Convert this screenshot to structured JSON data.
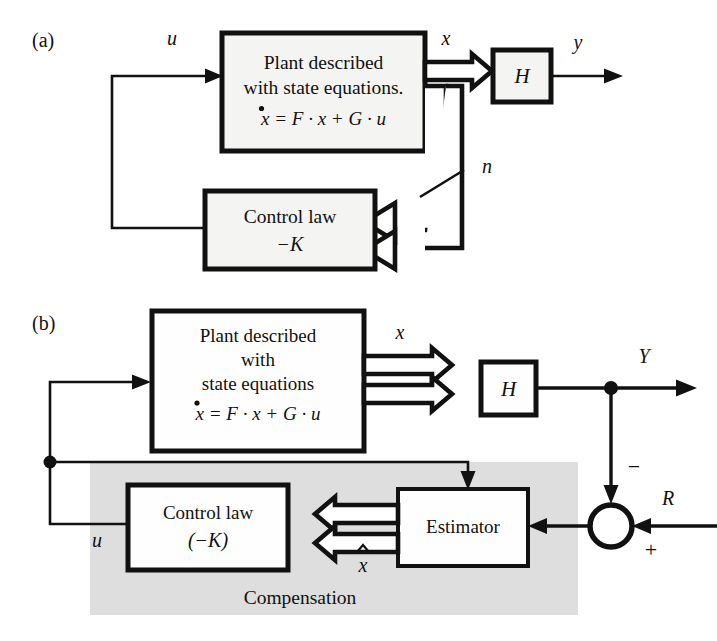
{
  "figure": {
    "type": "block-diagram",
    "panels": [
      {
        "id": "a",
        "label": "(a)",
        "caption": "State feedback using measured state",
        "blocks": [
          {
            "name": "plant",
            "lines": [
              "Plant described",
              "with state equations."
            ],
            "equation": "x = F · x + G · u",
            "equation_lhs": "x",
            "equation_lhs_accent": "dot"
          },
          {
            "name": "control-law",
            "lines": [
              "Control law"
            ],
            "gain": "−K"
          },
          {
            "name": "output-matrix",
            "label": "H"
          }
        ],
        "signals": [
          {
            "name": "u",
            "label": "u",
            "kind": "scalar"
          },
          {
            "name": "x",
            "label": "x",
            "kind": "vector"
          },
          {
            "name": "y",
            "label": "y",
            "kind": "scalar"
          },
          {
            "name": "n",
            "label": "n",
            "kind": "bus-width"
          }
        ]
      },
      {
        "id": "b",
        "label": "(b)",
        "caption": "Output feedback with estimator and compensation",
        "blocks": [
          {
            "name": "plant",
            "lines": [
              "Plant described",
              "with",
              "state equations"
            ],
            "equation": "x = F · x + G · u",
            "equation_lhs": "x",
            "equation_lhs_accent": "dot"
          },
          {
            "name": "control-law",
            "lines": [
              "Control law"
            ],
            "gain": "(−K)"
          },
          {
            "name": "estimator",
            "label": "Estimator"
          },
          {
            "name": "output-matrix",
            "label": "H"
          }
        ],
        "region": {
          "name": "compensation",
          "label": "Compensation",
          "fill": "#dedede"
        },
        "summing_junction": {
          "name": "summing-junction",
          "minus_sign": "−",
          "plus_sign": "+"
        },
        "signals": [
          {
            "name": "u",
            "label": "u",
            "kind": "scalar"
          },
          {
            "name": "x",
            "label": "x",
            "kind": "vector"
          },
          {
            "name": "x-hat",
            "label": "x",
            "accent": "hat",
            "kind": "vector"
          },
          {
            "name": "Y",
            "label": "Y",
            "kind": "scalar"
          },
          {
            "name": "R",
            "label": "R",
            "kind": "scalar"
          }
        ]
      }
    ]
  },
  "colors": {
    "ink": "#111111",
    "paper": "#ffffff",
    "block_fill_a": "#f4f4f2",
    "block_fill_b": "#fefefe",
    "compensation_shade": "#dedede"
  }
}
